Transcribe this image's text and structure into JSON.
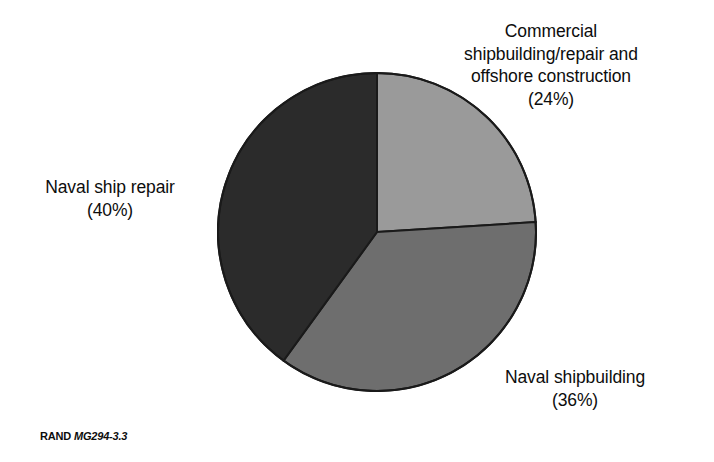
{
  "figure": {
    "caption_prefix": "RAND",
    "caption_id": "MG294-3.3",
    "background_color": "#ffffff"
  },
  "labels": {
    "commercial": "Commercial\nshipbuilding/repair and\noffshore construction\n(24%)",
    "naval_ship_repair": "Naval ship repair\n(40%)",
    "naval_shipbuilding": "Naval shipbuilding\n(36%)"
  },
  "chart_data": {
    "type": "pie",
    "title": "",
    "subtitle": "",
    "xlabel": "",
    "ylabel": "",
    "grid": false,
    "legend_position": "none",
    "label_style": "external-callout",
    "units": "percent",
    "start_angle_deg": 0,
    "direction": "clockwise",
    "categories": [
      "Commercial shipbuilding/repair and offshore construction",
      "Naval shipbuilding",
      "Naval ship repair"
    ],
    "values": [
      24,
      36,
      40
    ],
    "value_labels": [
      "(24%)",
      "(36%)",
      "(40%)"
    ],
    "colors": [
      "#9a9a9a",
      "#6e6e6e",
      "#2b2b2b"
    ],
    "slice_outline_color": "#1a1a1a",
    "total": 100,
    "slices": [
      {
        "name": "Commercial shipbuilding/repair and offshore construction",
        "value": 24,
        "label": "(24%)",
        "color": "#9a9a9a",
        "start_deg": 0,
        "end_deg": 86.4
      },
      {
        "name": "Naval shipbuilding",
        "value": 36,
        "label": "(36%)",
        "color": "#6e6e6e",
        "start_deg": 86.4,
        "end_deg": 216
      },
      {
        "name": "Naval ship repair",
        "value": 40,
        "label": "(40%)",
        "color": "#2b2b2b",
        "start_deg": 216,
        "end_deg": 360
      }
    ]
  }
}
